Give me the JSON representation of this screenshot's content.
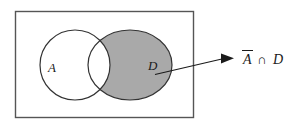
{
  "figure": {
    "type": "venn-diagram",
    "title": "",
    "background_color": "#ffffff",
    "universe": {
      "name": "universal-set-rectangle",
      "label": "",
      "stroke_color": "#555555",
      "fill_color": "#ffffff"
    },
    "sets": [
      {
        "id": "A",
        "label": "A",
        "shape": "circle",
        "fill_color": "#ffffff",
        "stroke_color": "#333333",
        "shaded": false
      },
      {
        "id": "D",
        "label": "D",
        "shape": "ellipse",
        "fill_color": "#a9a9a9",
        "stroke_color": "#333333",
        "shaded": true
      }
    ],
    "shaded_region": {
      "description": "complement-of-A-intersect-D",
      "fill_color": "#a9a9a9"
    },
    "intersection_region": {
      "description": "A-intersect-D",
      "fill_color": "#ffffff",
      "shaded": false
    },
    "annotation": {
      "name": "region-callout",
      "a_symbol": "A",
      "overbar": true,
      "operator": "∩",
      "d_symbol": "D",
      "full_text": "Ā ∩ D",
      "arrow_color": "#1a1a1a"
    }
  }
}
